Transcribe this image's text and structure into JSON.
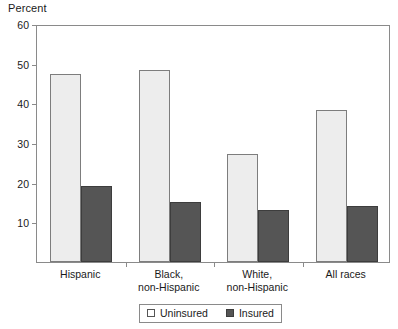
{
  "chart_data": {
    "type": "bar",
    "title": "",
    "subtitle": "",
    "xlabel": "",
    "ylabel": "Percent",
    "ylim": [
      0,
      60
    ],
    "ytick_values": [
      10,
      20,
      30,
      40,
      50,
      60
    ],
    "ytick_labels": [
      "10",
      "20",
      "30",
      "40",
      "50",
      "60"
    ],
    "grid": false,
    "legend_position": "bottom-center",
    "categories": [
      "Hispanic",
      "Black, non-Hispanic",
      "White, non-Hispanic",
      "All races"
    ],
    "category_lines": [
      [
        "Hispanic"
      ],
      [
        "Black,",
        "non-Hispanic"
      ],
      [
        "White,",
        "non-Hispanic"
      ],
      [
        "All races"
      ]
    ],
    "series": [
      {
        "name": "Uninsured",
        "color": "#ededed",
        "edge_color": "#7d7d7d",
        "values": [
          47.5,
          48.5,
          27.2,
          38.3
        ]
      },
      {
        "name": "Insured",
        "color": "#555555",
        "edge_color": "#3d3d3d",
        "values": [
          19.2,
          15.2,
          13.2,
          14.0
        ]
      }
    ]
  },
  "legend": {
    "entries": [
      {
        "label": "Uninsured",
        "swatch": "uninsured-swatch"
      },
      {
        "label": "Insured",
        "swatch": "insured-swatch"
      }
    ]
  },
  "axes": {
    "y_title": "Percent"
  }
}
